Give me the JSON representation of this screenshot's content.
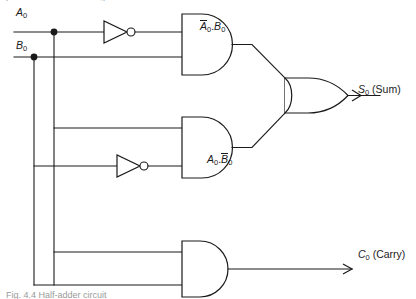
{
  "figure": {
    "kind": "logic-circuit-diagram",
    "top_cropped_text": "produces the ... sum ... g",
    "bottom_caption_cropped": "Fig. 4.4  Half-adder circuit"
  },
  "inputs": [
    {
      "id": "a0",
      "label_base": "A",
      "label_sub": "0",
      "y": 32
    },
    {
      "id": "b0",
      "label_base": "B",
      "label_sub": "0",
      "y": 57
    }
  ],
  "labels": {
    "not_a_and_b": {
      "term1_base": "A",
      "term1_sub": "0",
      "term1_overbar": true,
      "dot": ".",
      "term2_base": "B",
      "term2_sub": "0",
      "term2_overbar": false
    },
    "a_and_not_b": {
      "term1_base": "A",
      "term1_sub": "0",
      "term1_overbar": false,
      "dot": ".",
      "term2_base": "B",
      "term2_sub": "0",
      "term2_overbar": true
    }
  },
  "outputs": [
    {
      "id": "sum",
      "symbol": "S",
      "sub": "0",
      "name": "(Sum)"
    },
    {
      "id": "carry",
      "symbol": "C",
      "sub": "0",
      "name": "(Carry)"
    }
  ],
  "gates": [
    {
      "id": "inv-top",
      "type": "NOT",
      "name": "inverter-a0"
    },
    {
      "id": "inv-mid",
      "type": "NOT",
      "name": "inverter-b0"
    },
    {
      "id": "and-top",
      "type": "AND",
      "name": "and-gate-not-a-and-b"
    },
    {
      "id": "and-mid",
      "type": "AND",
      "name": "and-gate-a-and-not-b"
    },
    {
      "id": "and-bottom",
      "type": "AND",
      "name": "and-gate-carry"
    },
    {
      "id": "or-sum",
      "type": "OR",
      "name": "or-gate-sum"
    }
  ],
  "colors": {
    "line": "#1a1a1a",
    "fill": "#ffffff",
    "background": "#ffffff",
    "cropped_text": "#9a9a9a"
  }
}
